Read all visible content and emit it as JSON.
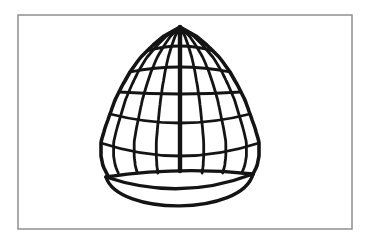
{
  "illustration": {
    "alt": "Black-and-white line drawing of a domed wire birdcage on an oval base tray, inside a thin gray rectangular frame",
    "background": "#ffffff",
    "frame": {
      "x": 18,
      "y": 15,
      "width": 334,
      "height": 214,
      "border_color": "#8f8f8f",
      "border_width": 1.5,
      "fill": "#ffffff"
    },
    "drawing": {
      "stroke_color": "#141414",
      "center_x": 180,
      "apex": {
        "x": 180,
        "y": 27
      },
      "profile": [
        [
          27,
          0
        ],
        [
          36,
          16
        ],
        [
          46,
          28
        ],
        [
          58,
          40
        ],
        [
          72,
          50
        ],
        [
          86,
          58
        ],
        [
          100,
          65
        ],
        [
          114,
          70
        ],
        [
          128,
          75
        ],
        [
          142,
          79
        ],
        [
          156,
          79
        ],
        [
          166,
          77
        ],
        [
          174,
          73
        ],
        [
          176,
          72
        ]
      ],
      "rib_fractions": [
        0.3,
        0.58,
        0.84
      ],
      "rib_base_y": 173,
      "outline_base_y": 176,
      "rings": [
        {
          "center_y": 46,
          "end_y": 51
        },
        {
          "center_y": 67,
          "end_y": 72
        },
        {
          "center_y": 94,
          "end_y": 92
        },
        {
          "center_y": 123,
          "end_y": 114
        },
        {
          "center_y": 156,
          "end_y": 143
        }
      ],
      "pole": {
        "top_y": 27,
        "bottom_y": 171
      },
      "base": {
        "left_x": 106,
        "left_y": 177,
        "right_x": 253,
        "right_y": 174,
        "back_ctrl_y": 166,
        "front_ctrl_y": 202,
        "bottom_ctrl_y": 216
      },
      "stroke_widths": {
        "outline": 3.6,
        "rib": 2.8,
        "ring": 2.8,
        "pole": 4.4,
        "rim": 3.4
      }
    }
  }
}
